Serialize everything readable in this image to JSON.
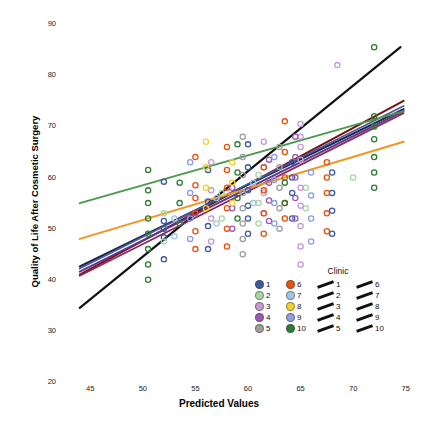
{
  "chart_data": {
    "type": "scatter",
    "title": "",
    "xlabel": "Predicted Values",
    "ylabel": "Quality of Life After Cosmetic Surgery",
    "xlim": [
      42.5,
      77.5
    ],
    "ylim": [
      20,
      92
    ],
    "xticks": [
      45,
      50,
      55,
      60,
      65,
      70,
      75
    ],
    "yticks": [
      20,
      30,
      40,
      50,
      60,
      70,
      80,
      90
    ],
    "grid": false,
    "marker": "open-circle",
    "legend": {
      "title": "Clinic",
      "position": "inside-lower-right",
      "entries": [
        {
          "label": "1",
          "color": "#3b5ba5",
          "line_color": "#111111"
        },
        {
          "label": "2",
          "color": "#a8d5a2",
          "line_color": "#111111"
        },
        {
          "label": "3",
          "color": "#c39bd3",
          "line_color": "#111111"
        },
        {
          "label": "4",
          "color": "#9b59b6",
          "line_color": "#111111"
        },
        {
          "label": "5",
          "color": "#9e9e9e",
          "line_color": "#111111"
        },
        {
          "label": "6",
          "color": "#e8520c",
          "line_color": "#111111"
        },
        {
          "label": "7",
          "color": "#9fc5e8",
          "line_color": "#111111"
        },
        {
          "label": "8",
          "color": "#f2d027",
          "line_color": "#111111"
        },
        {
          "label": "9",
          "color": "#8c9ee0",
          "line_color": "#111111"
        },
        {
          "label": "10",
          "color": "#2e7d32",
          "line_color": "#111111"
        }
      ]
    },
    "series": [
      {
        "name": "1",
        "color": "#3b5ba5",
        "line": {
          "x0": 44.0,
          "y0": 41.5,
          "x1": 74.8,
          "y1": 73.0
        },
        "points": [
          [
            52.0,
            59.2
          ],
          [
            52.0,
            51.5
          ],
          [
            52.0,
            50.0
          ],
          [
            52.0,
            48.3
          ],
          [
            52.0,
            44.0
          ],
          [
            56.2,
            61.5
          ],
          [
            56.2,
            55.3
          ],
          [
            56.2,
            50.5
          ],
          [
            56.2,
            46.0
          ],
          [
            60.0,
            66.5
          ],
          [
            60.0,
            62.0
          ],
          [
            60.0,
            57.5
          ],
          [
            60.0,
            54.5
          ],
          [
            60.0,
            52.0
          ],
          [
            60.0,
            49.0
          ],
          [
            64.2,
            63.0
          ],
          [
            64.2,
            60.0
          ],
          [
            64.2,
            57.0
          ],
          [
            64.2,
            52.0
          ],
          [
            68.0,
            61.0
          ],
          [
            68.0,
            57.0
          ],
          [
            68.0,
            53.5
          ],
          [
            68.0,
            49.0
          ]
        ]
      },
      {
        "name": "2",
        "color": "#a8d5a2",
        "line": {
          "x0": 44.0,
          "y0": 42.5,
          "x1": 74.8,
          "y1": 73.5
        },
        "points": [
          [
            52.0,
            53.0
          ],
          [
            52.0,
            47.5
          ],
          [
            57.5,
            57.0
          ],
          [
            57.5,
            52.0
          ],
          [
            61.0,
            60.5
          ],
          [
            61.0,
            55.0
          ],
          [
            61.0,
            51.0
          ],
          [
            65.5,
            58.0
          ],
          [
            65.5,
            54.0
          ],
          [
            70.0,
            60.0
          ]
        ]
      },
      {
        "name": "3",
        "color": "#c39bd3",
        "line": {
          "x0": 44.0,
          "y0": 42.0,
          "x1": 74.8,
          "y1": 72.5
        },
        "points": [
          [
            56.5,
            63.0
          ],
          [
            56.5,
            57.5
          ],
          [
            56.5,
            52.0
          ],
          [
            56.5,
            47.5
          ],
          [
            61.5,
            67.0
          ],
          [
            61.5,
            62.0
          ],
          [
            61.5,
            57.0
          ],
          [
            61.5,
            53.0
          ],
          [
            65.0,
            70.5
          ],
          [
            65.0,
            68.0
          ],
          [
            65.0,
            66.0
          ],
          [
            65.0,
            63.5
          ],
          [
            65.0,
            58.0
          ],
          [
            65.0,
            54.5
          ],
          [
            65.0,
            50.5
          ],
          [
            65.0,
            46.5
          ],
          [
            65.0,
            43.0
          ],
          [
            68.5,
            82.0
          ]
        ]
      },
      {
        "name": "4",
        "color": "#9b59b6",
        "line": {
          "x0": 44.0,
          "y0": 41.0,
          "x1": 74.8,
          "y1": 73.2
        },
        "points": [
          [
            58.5,
            58.0
          ],
          [
            58.5,
            54.0
          ],
          [
            58.5,
            50.0
          ],
          [
            62.0,
            63.5
          ],
          [
            62.0,
            59.0
          ],
          [
            62.0,
            55.5
          ],
          [
            62.0,
            51.5
          ],
          [
            64.5,
            68.0
          ],
          [
            64.5,
            64.0
          ],
          [
            64.5,
            60.0
          ],
          [
            64.5,
            56.0
          ],
          [
            64.5,
            52.0
          ]
        ]
      },
      {
        "name": "5",
        "color": "#9e9e9e",
        "line": {
          "x0": 44.0,
          "y0": 42.2,
          "x1": 74.8,
          "y1": 72.0
        },
        "points": [
          [
            59.5,
            68.0
          ],
          [
            59.5,
            64.0
          ],
          [
            59.5,
            60.5
          ],
          [
            59.5,
            57.0
          ],
          [
            59.5,
            54.0
          ],
          [
            59.5,
            51.0
          ],
          [
            59.5,
            48.0
          ],
          [
            59.5,
            45.0
          ],
          [
            63.0,
            66.0
          ],
          [
            63.0,
            62.0
          ],
          [
            63.0,
            58.0
          ],
          [
            63.0,
            54.0
          ],
          [
            63.0,
            50.0
          ]
        ]
      },
      {
        "name": "6",
        "color": "#e8520c",
        "line": {
          "x0": 44.0,
          "y0": 48.0,
          "x1": 74.8,
          "y1": 67.0
        },
        "points": [
          [
            55.0,
            64.0
          ],
          [
            55.0,
            58.5
          ],
          [
            55.0,
            56.0
          ],
          [
            55.0,
            53.0
          ],
          [
            55.0,
            49.5
          ],
          [
            55.0,
            46.0
          ],
          [
            58.0,
            66.0
          ],
          [
            58.0,
            61.5
          ],
          [
            58.0,
            58.0
          ],
          [
            58.0,
            54.0
          ],
          [
            58.0,
            50.0
          ],
          [
            58.0,
            46.5
          ],
          [
            61.5,
            62.0
          ],
          [
            61.5,
            57.5
          ],
          [
            61.5,
            53.0
          ],
          [
            61.5,
            49.0
          ],
          [
            63.5,
            71.0
          ],
          [
            63.5,
            65.0
          ],
          [
            63.5,
            60.0
          ],
          [
            63.5,
            55.0
          ],
          [
            63.5,
            52.0
          ],
          [
            67.5,
            63.0
          ],
          [
            67.5,
            60.0
          ],
          [
            67.5,
            57.0
          ],
          [
            67.5,
            53.0
          ],
          [
            67.5,
            49.5
          ]
        ]
      },
      {
        "name": "7",
        "color": "#9fc5e8",
        "line": {
          "x0": 44.0,
          "y0": 41.8,
          "x1": 74.8,
          "y1": 72.8
        },
        "points": [
          [
            53.0,
            52.0
          ],
          [
            53.0,
            48.5
          ],
          [
            57.0,
            56.0
          ],
          [
            57.0,
            51.0
          ],
          [
            60.5,
            59.0
          ],
          [
            60.5,
            55.0
          ]
        ]
      },
      {
        "name": "8",
        "color": "#f2d027",
        "line": {
          "x0": 44.0,
          "y0": 42.6,
          "x1": 74.8,
          "y1": 72.2
        },
        "points": [
          [
            56.0,
            67.0
          ],
          [
            56.0,
            62.0
          ],
          [
            56.0,
            58.0
          ],
          [
            56.0,
            54.0
          ],
          [
            58.5,
            63.0
          ],
          [
            58.5,
            59.0
          ],
          [
            58.5,
            55.0
          ]
        ]
      },
      {
        "name": "9",
        "color": "#8c9ee0",
        "line": {
          "x0": 44.0,
          "y0": 41.2,
          "x1": 74.8,
          "y1": 73.8
        },
        "points": [
          [
            54.5,
            63.0
          ],
          [
            54.5,
            57.0
          ],
          [
            54.5,
            52.0
          ],
          [
            54.5,
            48.0
          ],
          [
            62.5,
            64.0
          ],
          [
            62.5,
            59.5
          ],
          [
            62.5,
            55.0
          ],
          [
            62.5,
            51.0
          ],
          [
            66.0,
            61.0
          ],
          [
            66.0,
            56.5
          ],
          [
            66.0,
            52.0
          ],
          [
            66.0,
            47.5
          ]
        ]
      },
      {
        "name": "10",
        "color": "#2e7d32",
        "line": {
          "x0": 44.0,
          "y0": 55.0,
          "x1": 74.8,
          "y1": 73.0
        },
        "points": [
          [
            50.5,
            61.5
          ],
          [
            50.5,
            57.5
          ],
          [
            50.5,
            55.0
          ],
          [
            50.5,
            52.0
          ],
          [
            50.5,
            49.0
          ],
          [
            50.5,
            46.0
          ],
          [
            50.5,
            43.0
          ],
          [
            50.5,
            40.0
          ],
          [
            53.5,
            59.0
          ],
          [
            53.5,
            55.0
          ],
          [
            53.5,
            51.0
          ],
          [
            59.0,
            66.5
          ],
          [
            59.0,
            61.0
          ],
          [
            59.0,
            56.0
          ],
          [
            59.0,
            52.0
          ],
          [
            63.5,
            59.0
          ],
          [
            63.5,
            55.0
          ],
          [
            72.0,
            85.5
          ],
          [
            72.0,
            72.0
          ],
          [
            72.0,
            70.0
          ],
          [
            72.0,
            67.5
          ],
          [
            72.0,
            64.0
          ],
          [
            72.0,
            61.0
          ],
          [
            72.0,
            58.0
          ]
        ]
      }
    ],
    "regression_lines": [
      {
        "name": "black-steep",
        "color": "#111111",
        "x0": 44.0,
        "y0": 34.5,
        "x1": 74.5,
        "y1": 85.5,
        "width": 2.2
      },
      {
        "name": "darkred",
        "color": "#7a1010",
        "x0": 44.0,
        "y0": 41.0,
        "x1": 74.8,
        "y1": 75.0,
        "width": 2.0
      },
      {
        "name": "navy",
        "color": "#1a2352",
        "x0": 44.0,
        "y0": 42.6,
        "x1": 74.8,
        "y1": 73.4,
        "width": 2.0
      },
      {
        "name": "purple",
        "color": "#5b3a8e",
        "x0": 44.0,
        "y0": 41.6,
        "x1": 74.8,
        "y1": 73.0,
        "width": 2.0
      },
      {
        "name": "magenta",
        "color": "#8e2a5c",
        "x0": 44.0,
        "y0": 40.8,
        "x1": 74.8,
        "y1": 72.6,
        "width": 1.8
      },
      {
        "name": "slate-blue",
        "color": "#4a5a9e",
        "x0": 44.0,
        "y0": 42.2,
        "x1": 74.8,
        "y1": 74.0,
        "width": 1.8
      },
      {
        "name": "green",
        "color": "#4a9a4a",
        "x0": 44.0,
        "y0": 55.0,
        "x1": 74.8,
        "y1": 73.0,
        "width": 2.0
      },
      {
        "name": "orange",
        "color": "#f2951f",
        "x0": 44.0,
        "y0": 48.0,
        "x1": 74.8,
        "y1": 67.0,
        "width": 2.0
      }
    ]
  }
}
